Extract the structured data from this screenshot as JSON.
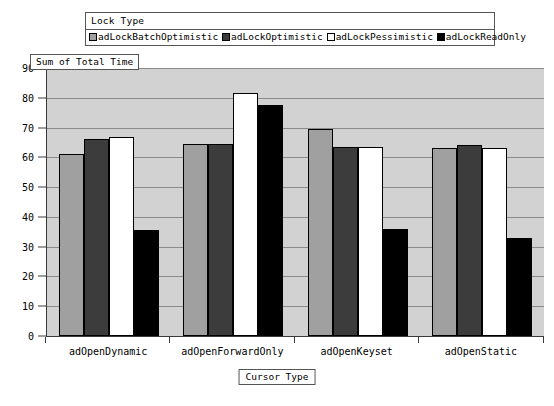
{
  "legend": {
    "title": "Lock Type",
    "items": [
      {
        "label": "adLockBatchOptimistic",
        "color": "#a0a0a0"
      },
      {
        "label": "adLockOptimistic",
        "color": "#3c3c3c"
      },
      {
        "label": "adLockPessimistic",
        "color": "#ffffff"
      },
      {
        "label": "adLockReadOnly",
        "color": "#000000"
      }
    ]
  },
  "axes": {
    "y_title": "Sum of Total Time",
    "x_title": "Cursor Type",
    "y_ticks": [
      "0",
      "10",
      "20",
      "30",
      "40",
      "50",
      "60",
      "70",
      "80",
      "90"
    ]
  },
  "chart_data": {
    "type": "bar",
    "title": "",
    "xlabel": "Cursor Type",
    "ylabel": "Sum of Total Time",
    "ylim": [
      0,
      90
    ],
    "ytick_step": 10,
    "grid": true,
    "legend_position": "top",
    "legend_title": "Lock Type",
    "categories": [
      "adOpenDynamic",
      "adOpenForwardOnly",
      "adOpenKeyset",
      "adOpenStatic"
    ],
    "series": [
      {
        "name": "adLockBatchOptimistic",
        "color": "#a0a0a0",
        "values": [
          61,
          64.5,
          69.5,
          63
        ]
      },
      {
        "name": "adLockOptimistic",
        "color": "#3c3c3c",
        "values": [
          66,
          64.5,
          63.5,
          64
        ]
      },
      {
        "name": "adLockPessimistic",
        "color": "#ffffff",
        "values": [
          67,
          81.5,
          63.5,
          63
        ]
      },
      {
        "name": "adLockReadOnly",
        "color": "#000000",
        "values": [
          35.5,
          77.5,
          36,
          33
        ]
      }
    ]
  }
}
